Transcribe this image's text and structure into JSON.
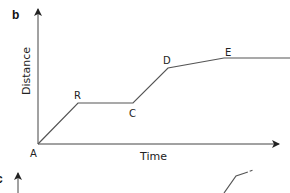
{
  "panels": [
    {
      "label": "b",
      "xlabel": "Time",
      "ylabel": "Distance",
      "points": [
        {
          "name": "A",
          "x": 38,
          "y": 144
        },
        {
          "name": "R",
          "x": 78,
          "y": 103
        },
        {
          "name": "C",
          "x": 133,
          "y": 103
        },
        {
          "name": "D",
          "x": 168,
          "y": 68
        },
        {
          "name": "E",
          "x": 224,
          "y": 58
        }
      ]
    },
    {
      "label": "c"
    }
  ],
  "colors": {
    "line": "#555555",
    "axis": "#444444",
    "text": "#222222"
  }
}
